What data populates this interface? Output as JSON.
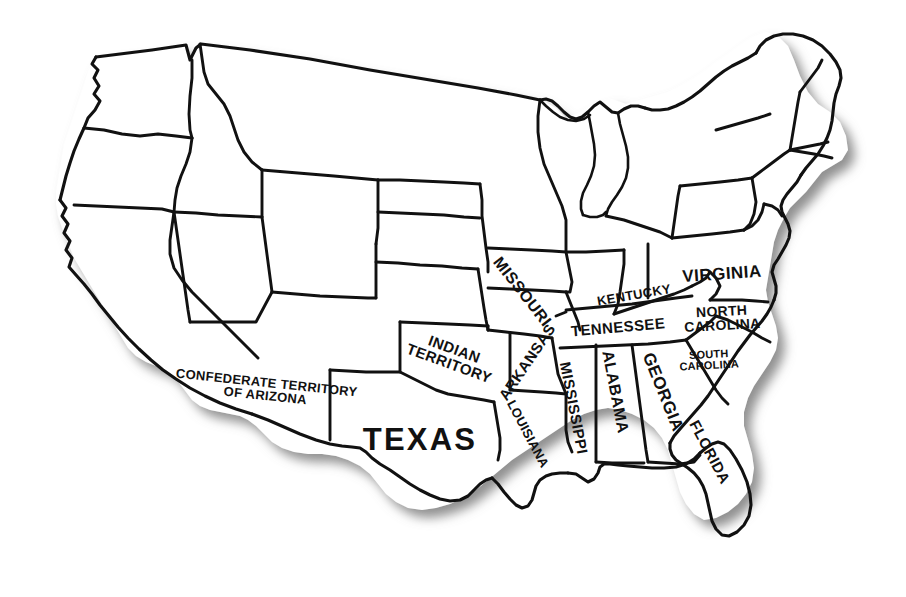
{
  "map": {
    "title": "Map of the United States showing the Confederate States",
    "description": "Black and white outline map of the United States with state borders; only the Confederate and border states of the American Civil War era are labeled.",
    "background_color": "#ffffff",
    "outline_color": "#111111",
    "shadow_color": "#8a8a8a",
    "label_color": "#111111",
    "projection_note": "simplified hand-drawn style",
    "labels": [
      {
        "id": "confederate-territory-of-arizona",
        "name": "CONFEDERATE TERRITORY OF ARIZONA",
        "lines": [
          "CONFEDERATE TERRITORY",
          "OF ARIZONA"
        ],
        "x": 266,
        "y": 389,
        "rotation": 6,
        "font_size": 13,
        "letter_spacing": 0.3
      },
      {
        "id": "texas",
        "name": "TEXAS",
        "lines": [
          "TEXAS"
        ],
        "x": 420,
        "y": 440,
        "rotation": 0,
        "font_size": 31,
        "letter_spacing": 2.2
      },
      {
        "id": "indian-territory",
        "name": "INDIAN TERRITORY",
        "lines": [
          "INDIAN",
          "TERRITORY"
        ],
        "x": 452,
        "y": 356,
        "rotation": 20,
        "font_size": 15,
        "letter_spacing": 0.4
      },
      {
        "id": "missouri",
        "name": "MISSOURI",
        "lines": [
          "MISSOURI"
        ],
        "x": 522,
        "y": 292,
        "rotation": 52,
        "font_size": 16,
        "letter_spacing": 0.5
      },
      {
        "id": "arkansas",
        "name": "ARKANSAS",
        "lines": [
          "ARKANSAS"
        ],
        "x": 527,
        "y": 362,
        "rotation": -56,
        "font_size": 15,
        "letter_spacing": 0.4
      },
      {
        "id": "louisiana",
        "name": "LOUISIANA",
        "lines": [
          "LOUISIANA"
        ],
        "x": 528,
        "y": 434,
        "rotation": 62,
        "font_size": 13,
        "letter_spacing": 0.3
      },
      {
        "id": "mississippi",
        "name": "MISSISSIPPI",
        "lines": [
          "MISSISSIPPI"
        ],
        "x": 574,
        "y": 408,
        "rotation": 79,
        "font_size": 15,
        "letter_spacing": 0.4
      },
      {
        "id": "alabama",
        "name": "ALABAMA",
        "lines": [
          "ALABAMA"
        ],
        "x": 615,
        "y": 392,
        "rotation": 79,
        "font_size": 16,
        "letter_spacing": 0.4
      },
      {
        "id": "georgia",
        "name": "GEORGIA",
        "lines": [
          "GEORGIA"
        ],
        "x": 663,
        "y": 392,
        "rotation": 68,
        "font_size": 17,
        "letter_spacing": 0.4
      },
      {
        "id": "florida",
        "name": "FLORIDA",
        "lines": [
          "FLORIDA"
        ],
        "x": 710,
        "y": 452,
        "rotation": 62,
        "font_size": 15,
        "letter_spacing": 0.4
      },
      {
        "id": "tennessee",
        "name": "TENNESSEE",
        "lines": [
          "TENNESSEE"
        ],
        "x": 618,
        "y": 327,
        "rotation": -5,
        "font_size": 15,
        "letter_spacing": 0.4
      },
      {
        "id": "kentucky",
        "name": "KENTUCKY",
        "lines": [
          "KENTUCKY"
        ],
        "x": 634,
        "y": 295,
        "rotation": -10,
        "font_size": 13,
        "letter_spacing": 0.3
      },
      {
        "id": "virginia",
        "name": "VIRGINIA",
        "lines": [
          "VIRGINIA"
        ],
        "x": 722,
        "y": 274,
        "rotation": -4,
        "font_size": 17,
        "letter_spacing": 0.5
      },
      {
        "id": "north-carolina",
        "name": "NORTH CAROLINA",
        "lines": [
          "NORTH",
          "CAROLINA"
        ],
        "x": 722,
        "y": 318,
        "rotation": -3,
        "font_size": 14,
        "letter_spacing": 0.3
      },
      {
        "id": "south-carolina",
        "name": "SOUTH CAROLINA",
        "lines": [
          "SOUTH",
          "CAROLINA"
        ],
        "x": 709,
        "y": 360,
        "rotation": -3,
        "font_size": 11,
        "letter_spacing": 0.2
      }
    ]
  }
}
